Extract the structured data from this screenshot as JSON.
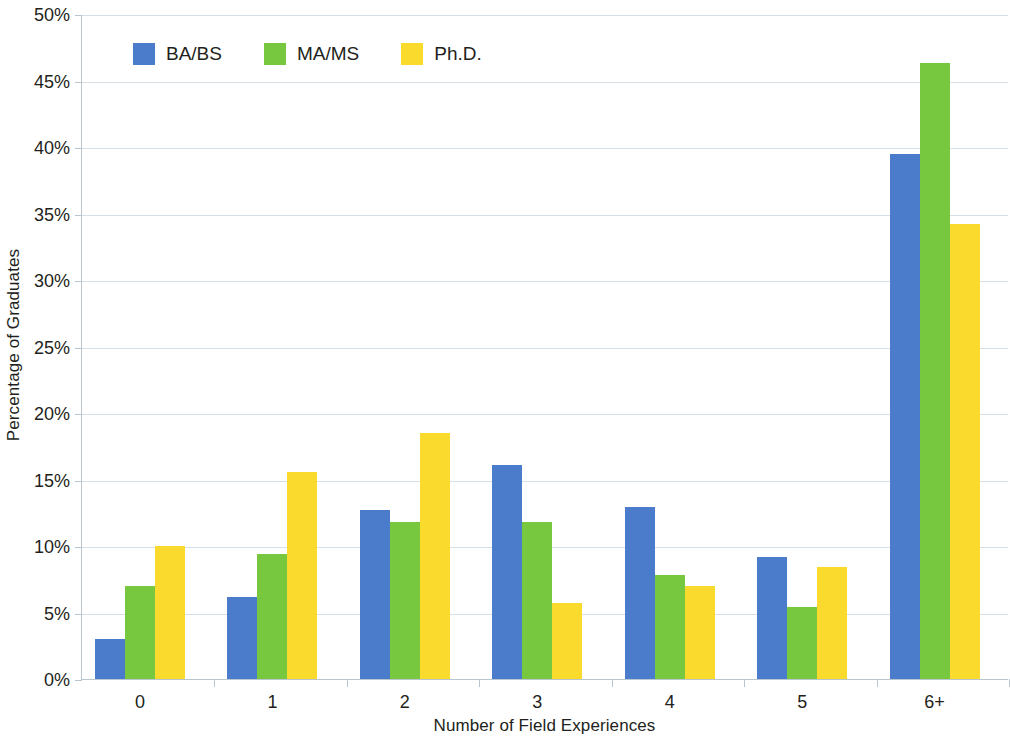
{
  "chart_data": {
    "type": "bar",
    "title": "",
    "subtitle": "",
    "xlabel": "Number of Field Experiences",
    "ylabel": "Percentage of Graduates",
    "categories": [
      "0",
      "1",
      "2",
      "3",
      "4",
      "5",
      "6+"
    ],
    "series": [
      {
        "name": "BA/BS",
        "color": "#4a7ccb",
        "values": [
          3.0,
          6.2,
          12.7,
          16.1,
          12.9,
          9.2,
          39.5
        ]
      },
      {
        "name": "MA/MS",
        "color": "#78c83f",
        "values": [
          7.0,
          9.4,
          11.8,
          11.8,
          7.8,
          5.4,
          46.3
        ]
      },
      {
        "name": "Ph.D.",
        "color": "#fada2d",
        "values": [
          10.0,
          15.6,
          18.5,
          5.7,
          7.0,
          8.4,
          34.2
        ]
      }
    ],
    "ylim": [
      0,
      50
    ],
    "ytick_step": 5,
    "ytick_labels": [
      "0%",
      "5%",
      "10%",
      "15%",
      "20%",
      "25%",
      "30%",
      "35%",
      "40%",
      "45%",
      "50%"
    ],
    "grid": true,
    "grid_axis": "y",
    "legend_position": "top-left-inside",
    "value_format": "percent",
    "background_color": "#ffffff",
    "grid_color": "#d6dfe5",
    "axis_color": "#b9c6cf",
    "text_color": "#231f20"
  }
}
